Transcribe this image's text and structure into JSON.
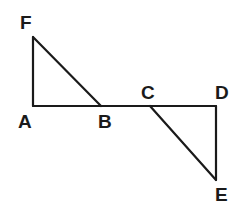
{
  "figure": {
    "canvas": {
      "width": 246,
      "height": 223,
      "background": "#ffffff"
    },
    "stroke": {
      "color": "#1a1a1a",
      "width": 2.2,
      "linecap": "round",
      "linejoin": "round"
    },
    "label_style": {
      "color": "#1a1a1a",
      "font_size": 19,
      "font_weight": "bold"
    },
    "points": {
      "A": {
        "x": 33,
        "y": 106
      },
      "B": {
        "x": 101,
        "y": 106
      },
      "C": {
        "x": 150,
        "y": 106
      },
      "D": {
        "x": 216,
        "y": 106
      },
      "E": {
        "x": 216,
        "y": 180
      },
      "F": {
        "x": 33,
        "y": 37
      }
    },
    "segments": [
      {
        "name": "segment-AD-baseline",
        "from": "A",
        "to": "D",
        "d": "M 33 106 L 216 106"
      },
      {
        "name": "segment-FA-vertical",
        "from": "F",
        "to": "A",
        "d": "M 33 37 L 33 106"
      },
      {
        "name": "segment-FB-hypotenuse",
        "from": "F",
        "to": "B",
        "d": "M 33 37 L 101 106"
      },
      {
        "name": "segment-DE-vertical",
        "from": "D",
        "to": "E",
        "d": "M 216 106 L 216 180"
      },
      {
        "name": "segment-CE-hypotenuse",
        "from": "C",
        "to": "E",
        "d": "M 150 106 L 216 180"
      }
    ],
    "labels": [
      {
        "name": "vertex-label-F",
        "text": "F",
        "left": 20,
        "top": 13
      },
      {
        "name": "vertex-label-A",
        "text": "A",
        "left": 18,
        "top": 112
      },
      {
        "name": "vertex-label-B",
        "text": "B",
        "left": 98,
        "top": 112
      },
      {
        "name": "vertex-label-C",
        "text": "C",
        "left": 141,
        "top": 83
      },
      {
        "name": "vertex-label-D",
        "text": "D",
        "left": 215,
        "top": 83
      },
      {
        "name": "vertex-label-E",
        "text": "E",
        "left": 215,
        "top": 185
      }
    ]
  }
}
